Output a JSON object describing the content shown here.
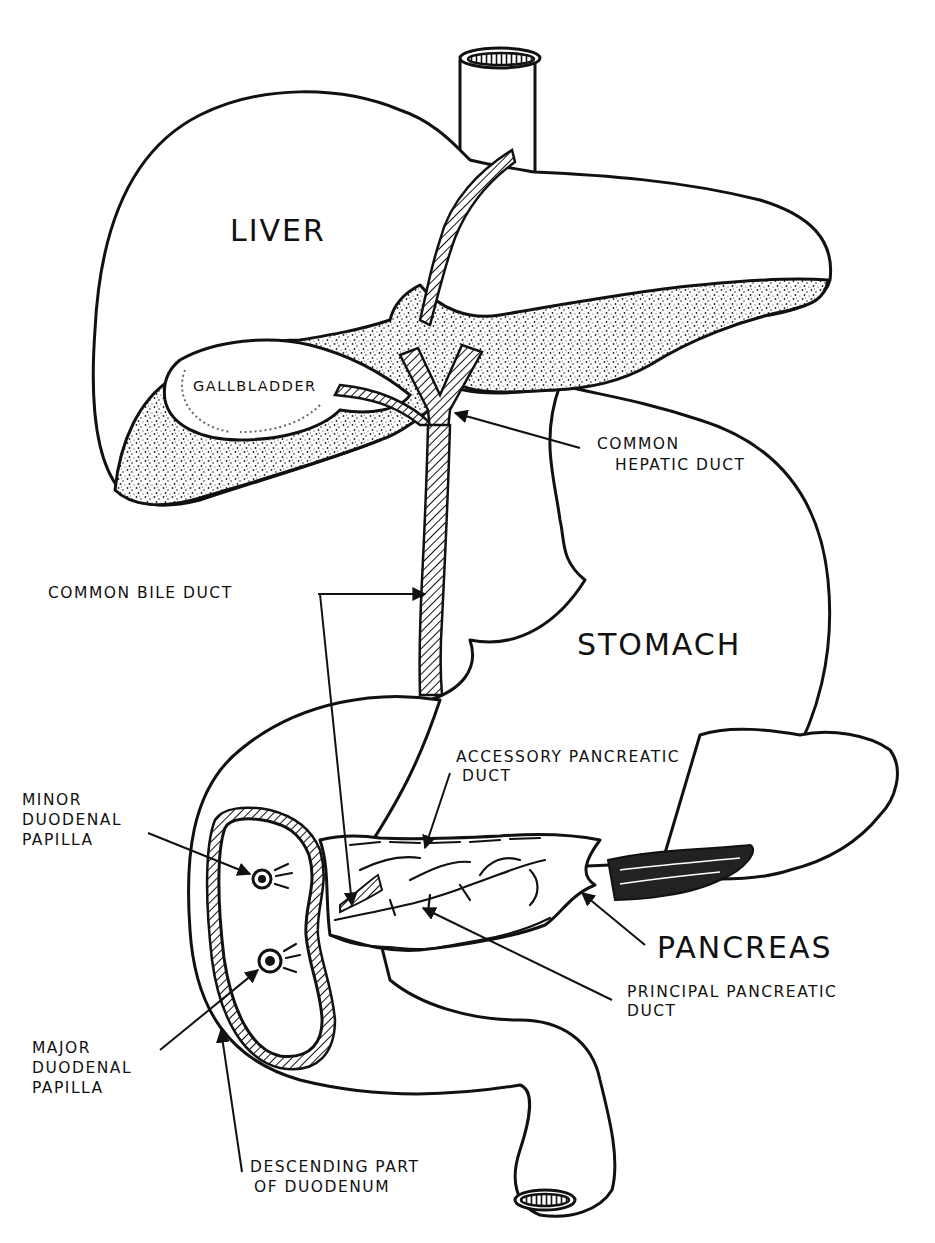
{
  "diagram": {
    "style": "black-and-white hand-drawn anatomical illustration",
    "colors": {
      "ink": "#111111",
      "background": "#ffffff"
    },
    "organ_labels": {
      "liver": "LIVER",
      "gallbladder": "GALLBLADDER",
      "stomach": "STOMACH",
      "pancreas": "PANCREAS"
    },
    "callouts": {
      "common_hepatic_duct": {
        "line1": "COMMON",
        "line2": "HEPATIC DUCT"
      },
      "common_bile_duct": {
        "line1": "COMMON BILE DUCT"
      },
      "accessory_pancreatic_duct": {
        "line1": "ACCESSORY PANCREATIC",
        "line2": "DUCT"
      },
      "minor_duodenal_papilla": {
        "line1": "MINOR",
        "line2": "DUODENAL",
        "line3": "PAPILLA"
      },
      "principal_pancreatic_duct": {
        "line1": "PRINCIPAL PANCREATIC",
        "line2": "DUCT"
      },
      "major_duodenal_papilla": {
        "line1": "MAJOR",
        "line2": "DUODENAL",
        "line3": "PAPILLA"
      },
      "descending_duodenum": {
        "line1": "DESCENDING PART",
        "line2": "OF DUODENUM"
      }
    }
  }
}
